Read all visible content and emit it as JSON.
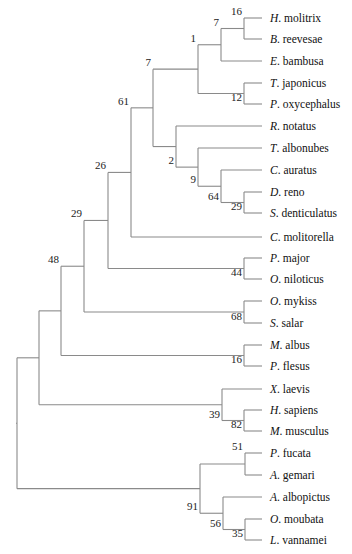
{
  "chart_data": {
    "type": "phylogenetic-tree",
    "title": "",
    "leaf_line_end_x": 262,
    "label_x": 270,
    "leaves": [
      {
        "id": "L1",
        "genus": "H",
        "species": "molitrix",
        "y": 18
      },
      {
        "id": "L2",
        "genus": "B",
        "species": "reevesae",
        "y": 39
      },
      {
        "id": "L3",
        "genus": "E",
        "species": "bambusa",
        "y": 61
      },
      {
        "id": "L4",
        "genus": "T",
        "species": "japonicus",
        "y": 83
      },
      {
        "id": "L5",
        "genus": "P",
        "species": "oxycephalus",
        "y": 104
      },
      {
        "id": "L6",
        "genus": "R",
        "species": "notatus",
        "y": 126
      },
      {
        "id": "L7",
        "genus": "T",
        "species": "albonubes",
        "y": 148
      },
      {
        "id": "L8",
        "genus": "C",
        "species": "auratus",
        "y": 170
      },
      {
        "id": "L9",
        "genus": "D",
        "species": "reno",
        "y": 192
      },
      {
        "id": "L10",
        "genus": "S",
        "species": "denticulatus",
        "y": 213
      },
      {
        "id": "L11",
        "genus": "C",
        "species": "molitorella",
        "y": 237
      },
      {
        "id": "L12",
        "genus": "P",
        "species": "major",
        "y": 258
      },
      {
        "id": "L13",
        "genus": "O",
        "species": "niloticus",
        "y": 279
      },
      {
        "id": "L14",
        "genus": "O",
        "species": "mykiss",
        "y": 301
      },
      {
        "id": "L15",
        "genus": "S",
        "species": "salar",
        "y": 323
      },
      {
        "id": "L16",
        "genus": "M",
        "species": "albus",
        "y": 345
      },
      {
        "id": "L17",
        "genus": "P",
        "species": "flesus",
        "y": 366
      },
      {
        "id": "L18",
        "genus": "X",
        "species": "laevis",
        "y": 389
      },
      {
        "id": "L19",
        "genus": "H",
        "species": "sapiens",
        "y": 410
      },
      {
        "id": "L20",
        "genus": "M",
        "species": "musculus",
        "y": 431
      },
      {
        "id": "L21",
        "genus": "P",
        "species": "fucata",
        "y": 453
      },
      {
        "id": "L22",
        "genus": "A",
        "species": "gemari",
        "y": 475
      },
      {
        "id": "L23",
        "genus": "A",
        "species": "albopictus",
        "y": 497
      },
      {
        "id": "L24",
        "genus": "O",
        "species": "moubata",
        "y": 519
      },
      {
        "id": "L25",
        "genus": "L",
        "species": "vannamei",
        "y": 540
      }
    ],
    "nodes": [
      {
        "id": "N16a",
        "x": 244,
        "children": [
          "L1",
          "L2"
        ],
        "support": "16",
        "label_pos": "above"
      },
      {
        "id": "N7a",
        "x": 221,
        "children": [
          "N16a",
          "L3"
        ],
        "support": "7",
        "label_pos": "above"
      },
      {
        "id": "N12",
        "x": 244,
        "children": [
          "L4",
          "L5"
        ],
        "support": "12",
        "label_pos": "below"
      },
      {
        "id": "N1",
        "x": 198,
        "children": [
          "N7a",
          "N12"
        ],
        "support": "1",
        "label_pos": "above"
      },
      {
        "id": "N29a",
        "x": 244,
        "children": [
          "L9",
          "L10"
        ],
        "support": "29",
        "label_pos": "below"
      },
      {
        "id": "N64",
        "x": 221,
        "children": [
          "L8",
          "N29a"
        ],
        "support": "64",
        "label_pos": "below"
      },
      {
        "id": "N9",
        "x": 198,
        "children": [
          "L7",
          "N64"
        ],
        "support": "9",
        "label_pos": "below"
      },
      {
        "id": "N2",
        "x": 176,
        "children": [
          "L6",
          "N9"
        ],
        "support": "2",
        "label_pos": "below"
      },
      {
        "id": "N7b",
        "x": 153,
        "children": [
          "N1",
          "N2"
        ],
        "support": "7",
        "label_pos": "above"
      },
      {
        "id": "N61",
        "x": 131,
        "children": [
          "N7b",
          "L11"
        ],
        "support": "61",
        "label_pos": "above"
      },
      {
        "id": "N44",
        "x": 244,
        "children": [
          "L12",
          "L13"
        ],
        "support": "44",
        "label_pos": "below"
      },
      {
        "id": "N26",
        "x": 108,
        "children": [
          "N61",
          "N44"
        ],
        "support": "26",
        "label_pos": "above"
      },
      {
        "id": "N68",
        "x": 244,
        "children": [
          "L14",
          "L15"
        ],
        "support": "68",
        "label_pos": "below"
      },
      {
        "id": "N29b",
        "x": 84,
        "children": [
          "N26",
          "N68"
        ],
        "support": "29",
        "label_pos": "above"
      },
      {
        "id": "N16b",
        "x": 244,
        "children": [
          "L16",
          "L17"
        ],
        "support": "16",
        "label_pos": "below"
      },
      {
        "id": "N48",
        "x": 61,
        "children": [
          "N29b",
          "N16b"
        ],
        "support": "48",
        "label_pos": "above"
      },
      {
        "id": "N82",
        "x": 244,
        "children": [
          "L19",
          "L20"
        ],
        "support": "82",
        "label_pos": "below"
      },
      {
        "id": "N39",
        "x": 222,
        "children": [
          "L18",
          "N82"
        ],
        "support": "39",
        "label_pos": "below"
      },
      {
        "id": "N48p",
        "x": 39,
        "children": [
          "N48",
          "N39"
        ],
        "support": "",
        "label_pos": "above"
      },
      {
        "id": "N51",
        "x": 245,
        "children": [
          "L21",
          "L22"
        ],
        "support": "51",
        "label_pos": "above"
      },
      {
        "id": "N35",
        "x": 245,
        "children": [
          "L24",
          "L25"
        ],
        "support": "35",
        "label_pos": "below"
      },
      {
        "id": "N56",
        "x": 223,
        "children": [
          "L23",
          "N35"
        ],
        "support": "56",
        "label_pos": "below"
      },
      {
        "id": "N91",
        "x": 200,
        "children": [
          "N51",
          "N56"
        ],
        "support": "91",
        "label_pos": "below"
      },
      {
        "id": "ROOT",
        "x": 17,
        "children": [
          "N48p",
          "N91"
        ],
        "support": "",
        "label_pos": "above"
      }
    ],
    "root": "ROOT",
    "support_values": [
      "16",
      "7",
      "12",
      "1",
      "29",
      "64",
      "9",
      "2",
      "7",
      "61",
      "44",
      "26",
      "68",
      "29",
      "16",
      "48",
      "82",
      "39",
      "51",
      "35",
      "56",
      "91"
    ],
    "edge_color": "#8a8a8a",
    "text_color": "#111111"
  }
}
